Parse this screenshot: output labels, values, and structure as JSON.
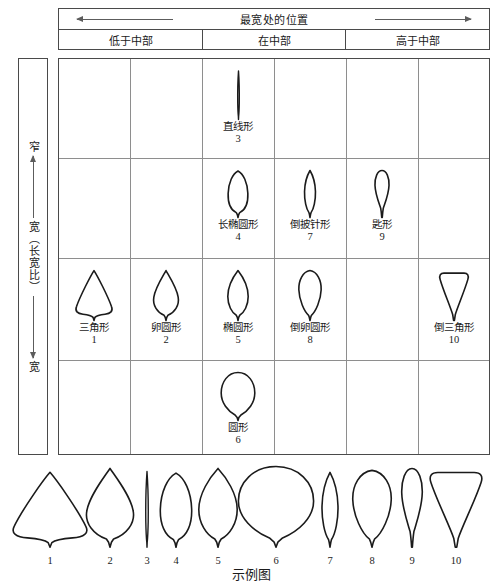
{
  "header": {
    "title": "最宽处的位置",
    "columns": [
      "低于中部",
      "在中部",
      "高于中部"
    ],
    "arrow_left": "left-arrow",
    "arrow_right": "right-arrow"
  },
  "yaxis": {
    "top_label": "窄",
    "middle_label": "宽（长宽比）",
    "bottom_label": "宽"
  },
  "grid": {
    "rows": 4,
    "subcolumns": 6,
    "cells": [
      {
        "row": 1,
        "col": 3,
        "name": "直线形",
        "num": "3",
        "shape": "linear"
      },
      {
        "row": 2,
        "col": 3,
        "name": "长椭圆形",
        "num": "4",
        "shape": "oblong"
      },
      {
        "row": 2,
        "col": 4,
        "name": "倒披针形",
        "num": "7",
        "shape": "oblanceolate"
      },
      {
        "row": 2,
        "col": 5,
        "name": "匙形",
        "num": "9",
        "shape": "spatulate"
      },
      {
        "row": 3,
        "col": 1,
        "name": "三角形",
        "num": "1",
        "shape": "triangular"
      },
      {
        "row": 3,
        "col": 2,
        "name": "卵圆形",
        "num": "2",
        "shape": "ovate"
      },
      {
        "row": 3,
        "col": 3,
        "name": "椭圆形",
        "num": "5",
        "shape": "elliptic"
      },
      {
        "row": 3,
        "col": 4,
        "name": "倒卵圆形",
        "num": "8",
        "shape": "obovate"
      },
      {
        "row": 3,
        "col": 6,
        "name": "倒三角形",
        "num": "10",
        "shape": "obtriangular"
      },
      {
        "row": 4,
        "col": 3,
        "name": "圆形",
        "num": "6",
        "shape": "orbicular"
      }
    ]
  },
  "examples": {
    "caption": "示例图",
    "items": [
      {
        "num": "1",
        "shape": "triangular"
      },
      {
        "num": "2",
        "shape": "ovate"
      },
      {
        "num": "3",
        "shape": "linear"
      },
      {
        "num": "4",
        "shape": "oblong"
      },
      {
        "num": "5",
        "shape": "elliptic"
      },
      {
        "num": "6",
        "shape": "orbicular"
      },
      {
        "num": "7",
        "shape": "oblanceolate"
      },
      {
        "num": "8",
        "shape": "obovate"
      },
      {
        "num": "9",
        "shape": "spatulate"
      },
      {
        "num": "10",
        "shape": "obtriangular"
      }
    ]
  },
  "colors": {
    "ink": "#1b1b1b",
    "rule": "#4a4a4a",
    "grid_rule": "#8e8e8e",
    "paper": "#ffffff"
  }
}
